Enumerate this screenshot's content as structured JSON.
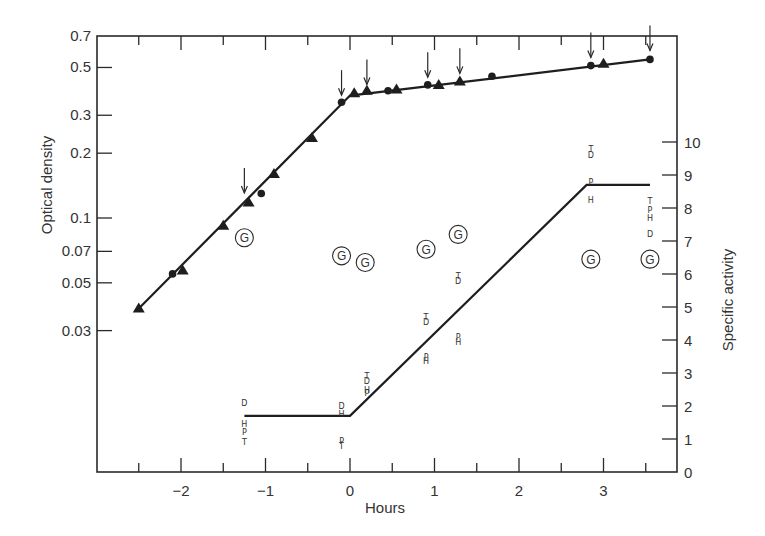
{
  "chart_data": {
    "type": "line",
    "title": "",
    "xlabel": "Hours",
    "ylabel_left": "Optical density",
    "ylabel_right": "Specific activity",
    "x_ticks": [
      -2,
      -1,
      0,
      1,
      2,
      3
    ],
    "x_tick_labels": [
      "−2",
      "−1",
      "0",
      "1",
      "2",
      "3"
    ],
    "xlim": [
      -3.0,
      3.9
    ],
    "left_axis": {
      "scale": "log",
      "ticks": [
        0.03,
        0.05,
        0.07,
        0.1,
        0.2,
        0.3,
        0.5,
        0.7
      ],
      "tick_labels": [
        "0.03",
        "0.05",
        "0.07",
        "0.1",
        "0.2",
        "0.3",
        "0.5",
        "0.7"
      ],
      "ylim": [
        0.012,
        0.7
      ]
    },
    "right_axis": {
      "scale": "linear",
      "ticks": [
        0,
        1,
        2,
        3,
        4,
        5,
        6,
        7,
        8,
        9,
        10
      ],
      "tick_labels": [
        "0",
        "1",
        "2",
        "3",
        "4",
        "5",
        "6",
        "7",
        "8",
        "9",
        "10"
      ],
      "ylim": [
        0,
        10
      ]
    },
    "series": [
      {
        "name": "Optical density (triangles)",
        "axis": "left",
        "marker": "triangle",
        "points": [
          [
            -2.5,
            0.038
          ],
          [
            -1.98,
            0.057
          ],
          [
            -1.5,
            0.092
          ],
          [
            -1.2,
            0.118
          ],
          [
            -0.9,
            0.16
          ],
          [
            -0.45,
            0.235
          ],
          [
            0.05,
            0.38
          ],
          [
            0.2,
            0.39
          ],
          [
            0.55,
            0.395
          ],
          [
            1.05,
            0.415
          ],
          [
            1.3,
            0.43
          ],
          [
            3.0,
            0.52
          ]
        ]
      },
      {
        "name": "Optical density (circles)",
        "axis": "left",
        "marker": "circle",
        "points": [
          [
            -2.1,
            0.055
          ],
          [
            -1.05,
            0.13
          ],
          [
            -0.1,
            0.345
          ],
          [
            0.45,
            0.39
          ],
          [
            0.92,
            0.415
          ],
          [
            1.68,
            0.455
          ],
          [
            2.85,
            0.51
          ],
          [
            3.55,
            0.545
          ]
        ]
      },
      {
        "name": "Optical density fit",
        "axis": "left",
        "marker": "none",
        "points": [
          [
            -2.5,
            0.038
          ],
          [
            0.0,
            0.37
          ],
          [
            3.55,
            0.545
          ]
        ]
      },
      {
        "name": "Specific activity fit",
        "axis": "right",
        "marker": "none",
        "points": [
          [
            -1.25,
            1.7
          ],
          [
            0.0,
            1.7
          ],
          [
            2.8,
            8.7
          ],
          [
            3.55,
            8.7
          ]
        ]
      }
    ],
    "letter_points": [
      {
        "x": -1.25,
        "letters": [
          {
            "t": "D",
            "y": 2.1
          },
          {
            "t": "H",
            "y": 1.45
          },
          {
            "t": "P",
            "y": 1.2
          },
          {
            "t": "T",
            "y": 0.9
          }
        ]
      },
      {
        "x": -0.1,
        "letters": [
          {
            "t": "D",
            "y": 2.0
          },
          {
            "t": "H",
            "y": 1.75
          },
          {
            "t": "P",
            "y": 0.95
          },
          {
            "t": "T",
            "y": 0.8
          }
        ]
      },
      {
        "x": 0.2,
        "letters": [
          {
            "t": "T",
            "y": 2.9
          },
          {
            "t": "D",
            "y": 2.75
          },
          {
            "t": "H",
            "y": 2.5
          },
          {
            "t": "P",
            "y": 2.4
          }
        ]
      },
      {
        "x": 0.9,
        "letters": [
          {
            "t": "T",
            "y": 4.7
          },
          {
            "t": "D",
            "y": 4.55
          },
          {
            "t": "P",
            "y": 3.5
          },
          {
            "t": "H",
            "y": 3.35
          }
        ]
      },
      {
        "x": 1.28,
        "letters": [
          {
            "t": "T",
            "y": 5.95
          },
          {
            "t": "D",
            "y": 5.8
          },
          {
            "t": "P",
            "y": 4.1
          },
          {
            "t": "H",
            "y": 3.95
          }
        ]
      },
      {
        "x": 2.85,
        "letters": [
          {
            "t": "T",
            "y": 9.8
          },
          {
            "t": "D",
            "y": 9.6
          },
          {
            "t": "P",
            "y": 8.8
          },
          {
            "t": "H",
            "y": 8.25
          }
        ]
      },
      {
        "x": 3.55,
        "letters": [
          {
            "t": "T",
            "y": 8.2
          },
          {
            "t": "P",
            "y": 7.95
          },
          {
            "t": "H",
            "y": 7.7
          },
          {
            "t": "D",
            "y": 7.2
          }
        ]
      }
    ],
    "g_markers": {
      "label": "G",
      "points": [
        [
          -1.25,
          7.1
        ],
        [
          -0.1,
          6.55
        ],
        [
          0.18,
          6.35
        ],
        [
          0.9,
          6.75
        ],
        [
          1.28,
          7.2
        ],
        [
          2.85,
          6.45
        ],
        [
          3.55,
          6.45
        ]
      ]
    },
    "arrows_x": [
      -1.25,
      -0.1,
      0.2,
      0.92,
      1.3,
      2.85,
      3.55
    ],
    "grid": false,
    "legend": "none"
  }
}
